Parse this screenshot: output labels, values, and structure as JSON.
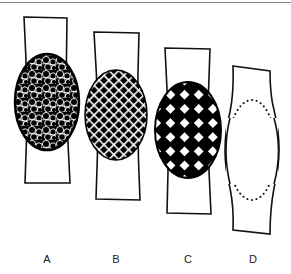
{
  "figure": {
    "panels": [
      {
        "id": "A",
        "label": "A",
        "pattern": "irregular-white-mesh-on-black",
        "label_x": 37
      },
      {
        "id": "B",
        "label": "B",
        "pattern": "fine-diagonal-white-grid-on-black",
        "label_x": 106
      },
      {
        "id": "C",
        "label": "C",
        "pattern": "coarse-black-white-checker",
        "label_x": 178
      },
      {
        "id": "D",
        "label": "D",
        "pattern": "dotted-outline-empty",
        "label_x": 243
      }
    ],
    "colors": {
      "stroke": "#111111",
      "fill_dark": "#000000",
      "fill_light": "#ffffff",
      "rule": "#8a8a8a"
    }
  }
}
